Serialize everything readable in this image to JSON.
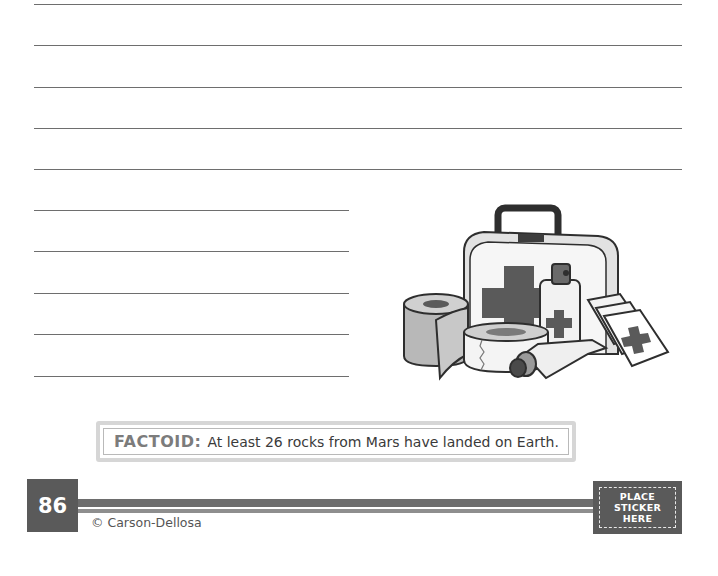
{
  "worksheet": {
    "writing_lines": {
      "full_width_count": 5,
      "short_count": 5
    },
    "illustration": {
      "subject": "first-aid-kit",
      "items": [
        "first-aid-case",
        "gauze-roll",
        "adhesive-tape-roll",
        "spray-bottle",
        "ointment-tube",
        "bandage-packets"
      ]
    },
    "factoid": {
      "label": "FACTOID:",
      "text": "At least 26 rocks from Mars have landed on Earth."
    }
  },
  "footer": {
    "page_number": "86",
    "copyright": "© Carson-Dellosa",
    "sticker": {
      "lines": [
        "PLACE",
        "STICKER",
        "HERE"
      ]
    }
  },
  "colors": {
    "ink": "#3a3a3a",
    "factoid_label": "#7c7c7c",
    "footer_box": "#5a5a5a",
    "rule": "#6e6e6e"
  }
}
